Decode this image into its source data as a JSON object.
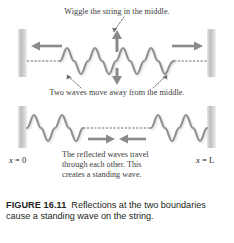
{
  "figure": {
    "number_label": "FIGURE 16.11",
    "caption_text": "Reflections at the two boundaries cause a standing wave on the string.",
    "caption_full": "FIGURE 16.11 Reflections at the two boundaries cause a standing wave on the string."
  },
  "annotations": {
    "top": "Wiggle the string in the middle.",
    "middle": "Two waves move away from the middle.",
    "explain_line1": "The reflected waves travel",
    "explain_line2": "through each other. This",
    "explain_line3": "creates a standing wave."
  },
  "axis_labels": {
    "left": "x = 0",
    "left_var": "x",
    "left_eq": "= 0",
    "right": "x = L",
    "right_var": "x",
    "right_eq": "= L"
  },
  "icons": {
    "arrow_left": "arrow-left-icon",
    "arrow_right": "arrow-right-icon",
    "arrow_up": "arrow-up-icon",
    "arrow_down": "arrow-down-icon",
    "arrow_inward_left": "arrow-right-inward-icon",
    "arrow_inward_right": "arrow-left-inward-icon",
    "leader_dotted": "dotted-leader-icon",
    "post_left": "wall-post-left-icon",
    "post_right": "wall-post-right-icon"
  },
  "colors": {
    "wave_stroke": "#8c8c8c",
    "wave_shadow": "#c9c9c9",
    "arrow_gray": "#888888",
    "post_gray": "#c4c4c4",
    "string_rest": "#9a9a9a",
    "text_dark": "#231f20",
    "text_anno": "#3b3b3b",
    "background": "#ffffff"
  },
  "panels": [
    {
      "id": "panel-top",
      "description": "String driven at the middle; two waves travel outward toward both fixed boundaries.",
      "wave_cycles": 6,
      "center_arrow": "vertical-double",
      "edge_arrows": [
        "left",
        "right"
      ]
    },
    {
      "id": "panel-bottom",
      "description": "Reflected waves travel back through each other creating a standing wave.",
      "wave_cycles": 6,
      "center_arrows": [
        "right",
        "left"
      ]
    }
  ]
}
